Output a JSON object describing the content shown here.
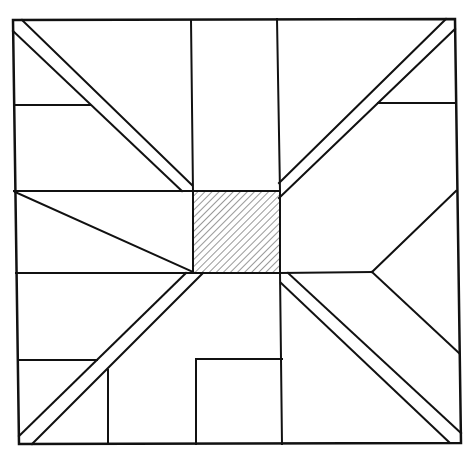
{
  "diagram": {
    "type": "quilt-block-pattern",
    "canvas": {
      "width": 474,
      "height": 457
    },
    "colors": {
      "line": "#111111",
      "background": "#ffffff",
      "hatch": "#333333"
    },
    "stroke_width": 2,
    "outer_square": [
      [
        13,
        20
      ],
      [
        455,
        19
      ],
      [
        461,
        443
      ],
      [
        19,
        444
      ]
    ],
    "center_square": {
      "x": 193,
      "y": 191,
      "w": 87,
      "h": 82,
      "fill": "diagonal-hatch"
    },
    "lines": [
      {
        "name": "top-left-vertical",
        "points": [
          [
            191,
            20
          ],
          [
            193,
            191
          ]
        ]
      },
      {
        "name": "top-right-vertical",
        "points": [
          [
            277,
            19
          ],
          [
            280,
            191
          ]
        ]
      },
      {
        "name": "left-upper-horizontal",
        "points": [
          [
            14,
            191
          ],
          [
            193,
            191
          ]
        ]
      },
      {
        "name": "left-lower-horizontal",
        "points": [
          [
            16,
            273
          ],
          [
            193,
            273
          ]
        ]
      },
      {
        "name": "right-middle-horizontal",
        "points": [
          [
            280,
            273
          ],
          [
            372,
            272
          ]
        ]
      },
      {
        "name": "left-wedge-diagonal",
        "points": [
          [
            15,
            192
          ],
          [
            193,
            272
          ]
        ]
      },
      {
        "name": "right-triangle-upper",
        "points": [
          [
            372,
            272
          ],
          [
            456,
            191
          ]
        ]
      },
      {
        "name": "right-triangle-lower",
        "points": [
          [
            372,
            272
          ],
          [
            459,
            353
          ]
        ]
      },
      {
        "name": "left-top-shelf",
        "points": [
          [
            14,
            105
          ],
          [
            90,
            105
          ]
        ]
      },
      {
        "name": "right-top-shelf",
        "points": [
          [
            378,
            103
          ],
          [
            455,
            103
          ]
        ]
      },
      {
        "name": "left-bottom-shelf",
        "points": [
          [
            18,
            360
          ],
          [
            97,
            360
          ]
        ]
      },
      {
        "name": "left-bottom-vertical",
        "points": [
          [
            108,
            370
          ],
          [
            108,
            444
          ]
        ]
      },
      {
        "name": "bottom-inner-rect-left",
        "points": [
          [
            196,
            444
          ],
          [
            196,
            359
          ]
        ]
      },
      {
        "name": "bottom-inner-rect-top",
        "points": [
          [
            196,
            359
          ],
          [
            282,
            359
          ]
        ]
      },
      {
        "name": "center-right-vertical-down",
        "points": [
          [
            280,
            273
          ],
          [
            282,
            444
          ]
        ]
      },
      {
        "name": "nw-strip-outer",
        "points": [
          [
            22,
            20
          ],
          [
            192,
            185
          ]
        ]
      },
      {
        "name": "nw-strip-inner",
        "points": [
          [
            13,
            31
          ],
          [
            182,
            191
          ]
        ]
      },
      {
        "name": "ne-strip-outer",
        "points": [
          [
            446,
            19
          ],
          [
            279,
            183
          ]
        ]
      },
      {
        "name": "ne-strip-inner",
        "points": [
          [
            455,
            29
          ],
          [
            279,
            198
          ]
        ]
      },
      {
        "name": "sw-strip-outer",
        "points": [
          [
            186,
            273
          ],
          [
            19,
            436
          ]
        ]
      },
      {
        "name": "sw-strip-inner",
        "points": [
          [
            203,
            273
          ],
          [
            32,
            444
          ]
        ]
      },
      {
        "name": "se-strip-outer",
        "points": [
          [
            288,
            273
          ],
          [
            461,
            433
          ]
        ]
      },
      {
        "name": "se-strip-inner",
        "points": [
          [
            281,
            283
          ],
          [
            449,
            442
          ]
        ]
      }
    ]
  }
}
